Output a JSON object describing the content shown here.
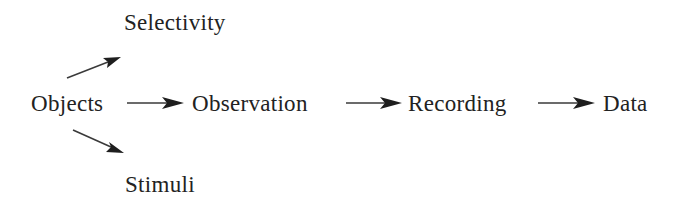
{
  "diagram": {
    "type": "flow",
    "colors": {
      "text": "#222222",
      "arrow": "#1e1e1e",
      "background": "#ffffff"
    },
    "nodes": {
      "objects": "Objects",
      "observation": "Observation",
      "recording": "Recording",
      "data": "Data",
      "selectivity": "Selectivity",
      "stimuli": "Stimuli"
    },
    "edges": [
      {
        "from": "Objects",
        "to": "Selectivity"
      },
      {
        "from": "Objects",
        "to": "Stimuli"
      },
      {
        "from": "Objects",
        "to": "Observation"
      },
      {
        "from": "Observation",
        "to": "Recording"
      },
      {
        "from": "Recording",
        "to": "Data"
      }
    ]
  }
}
